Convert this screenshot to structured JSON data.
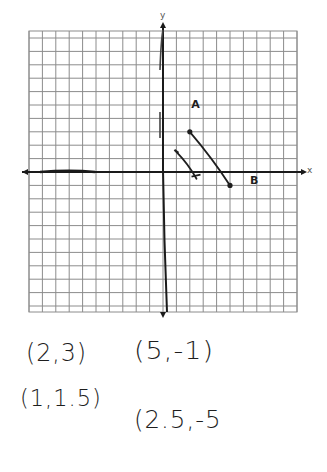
{
  "chart_data": {
    "type": "scatter",
    "title": "",
    "xlabel": "x",
    "ylabel": "y",
    "xlim": [
      -10,
      10
    ],
    "ylim": [
      -10.5,
      10.5
    ],
    "grid": true,
    "grid_cell_px": 13.4,
    "origin_px": [
      163,
      172
    ],
    "segments": [
      {
        "name": "AB",
        "start_label": "A",
        "end_label": "B",
        "points": [
          {
            "x": 2,
            "y": 3
          },
          {
            "x": 5,
            "y": -1
          }
        ],
        "endpoint_style": "dot"
      },
      {
        "name": "short-segment",
        "points": [
          {
            "x": 1,
            "y": 1.5
          },
          {
            "x": 2.5,
            "y": -0.5
          }
        ],
        "endpoint_style": "cap"
      }
    ],
    "annotations": [
      {
        "text": "A",
        "x": 2.1,
        "y": 4.8
      },
      {
        "text": "B",
        "x": 6.5,
        "y": -0.9
      }
    ]
  },
  "axes": {
    "x_label": "x",
    "y_label": "y"
  },
  "handwritten_coordinates": [
    {
      "text": "(2,3)"
    },
    {
      "text": "(5,-1)"
    },
    {
      "text": "(1,1.5)"
    },
    {
      "text": "(2.5,-5"
    }
  ],
  "colors": {
    "grid": "#8c8c8c",
    "axis": "#1a1a1a",
    "ink": "#1e1e1e",
    "background": "#ffffff"
  }
}
